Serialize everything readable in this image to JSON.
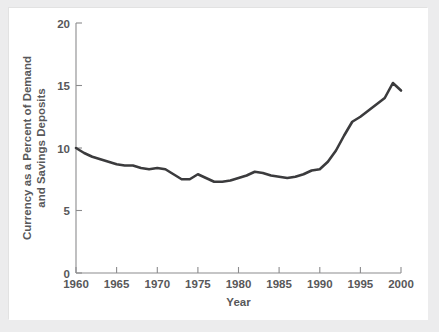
{
  "figure": {
    "background_color": "#ececed",
    "card_color": "#ffffff",
    "line_color": "#3b3b3d",
    "axis_color": "#8b8b8d",
    "text_color": "#58585a"
  },
  "chart_data": {
    "type": "line",
    "title": "",
    "subtitle": "",
    "xlabel": "Year",
    "ylabel": "Currency as a Percent of Demand and Savings Deposits",
    "ylabel_line1": "Currency as a Percent of Demand",
    "ylabel_line2": "and Savings Deposits",
    "xlim": [
      1960,
      2000
    ],
    "ylim": [
      0,
      20
    ],
    "xticks": [
      1960,
      1965,
      1970,
      1975,
      1980,
      1985,
      1990,
      1995,
      2000
    ],
    "xtick_labels": [
      "1960",
      "1965",
      "1970",
      "1975",
      "1980",
      "1985",
      "1990",
      "1995",
      "2000"
    ],
    "yticks": [
      0,
      5,
      10,
      15,
      20
    ],
    "ytick_labels": [
      "0",
      "5",
      "10",
      "15",
      "20"
    ],
    "grid": false,
    "legend": false,
    "legend_position": "none",
    "x": [
      1960,
      1961,
      1962,
      1963,
      1964,
      1965,
      1966,
      1967,
      1968,
      1969,
      1970,
      1971,
      1972,
      1973,
      1974,
      1975,
      1976,
      1977,
      1978,
      1979,
      1980,
      1981,
      1982,
      1983,
      1984,
      1985,
      1986,
      1987,
      1988,
      1989,
      1990,
      1991,
      1992,
      1993,
      1994,
      1995,
      1996,
      1997,
      1998,
      1999,
      2000
    ],
    "series": [
      {
        "name": "Currency as a Percent of Demand and Savings Deposits",
        "color": "#3b3b3d",
        "values": [
          10.0,
          9.6,
          9.3,
          9.1,
          8.9,
          8.7,
          8.6,
          8.6,
          8.4,
          8.3,
          8.4,
          8.3,
          7.9,
          7.5,
          7.5,
          7.9,
          7.6,
          7.3,
          7.3,
          7.4,
          7.6,
          7.8,
          8.1,
          8.0,
          7.8,
          7.7,
          7.6,
          7.7,
          7.9,
          8.2,
          8.3,
          8.9,
          9.8,
          11.0,
          12.1,
          12.5,
          13.0,
          13.5,
          14.0,
          15.2,
          14.6
        ]
      }
    ]
  }
}
